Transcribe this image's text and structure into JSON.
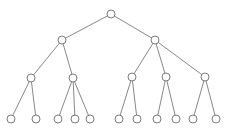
{
  "diagram": {
    "type": "tree",
    "levels": 4,
    "node_radius": 4,
    "colors": {
      "edge": "#7a7a7a",
      "node_stroke": "#6e6e6e",
      "node_fill": "#ffffff",
      "background": "#ffffff"
    },
    "nodes": [
      {
        "id": "root",
        "x": 111,
        "y": 14,
        "level": 0
      },
      {
        "id": "a",
        "x": 62,
        "y": 40,
        "level": 1,
        "parent": "root"
      },
      {
        "id": "b",
        "x": 155,
        "y": 40,
        "level": 1,
        "parent": "root"
      },
      {
        "id": "a1",
        "x": 31,
        "y": 78,
        "level": 2,
        "parent": "a"
      },
      {
        "id": "a2",
        "x": 73,
        "y": 78,
        "level": 2,
        "parent": "a"
      },
      {
        "id": "b1",
        "x": 132,
        "y": 77,
        "level": 2,
        "parent": "b"
      },
      {
        "id": "b2",
        "x": 166,
        "y": 77,
        "level": 2,
        "parent": "b"
      },
      {
        "id": "b3",
        "x": 205,
        "y": 77,
        "level": 2,
        "parent": "b"
      },
      {
        "id": "a1x",
        "x": 11,
        "y": 119,
        "level": 3,
        "parent": "a1"
      },
      {
        "id": "a1y",
        "x": 36,
        "y": 119,
        "level": 3,
        "parent": "a1"
      },
      {
        "id": "a2x",
        "x": 58,
        "y": 119,
        "level": 3,
        "parent": "a2"
      },
      {
        "id": "a2y",
        "x": 75,
        "y": 119,
        "level": 3,
        "parent": "a2"
      },
      {
        "id": "a2z",
        "x": 90,
        "y": 119,
        "level": 3,
        "parent": "a2"
      },
      {
        "id": "b1x",
        "x": 119,
        "y": 119,
        "level": 3,
        "parent": "b1"
      },
      {
        "id": "b1y",
        "x": 137,
        "y": 119,
        "level": 3,
        "parent": "b1"
      },
      {
        "id": "b2x",
        "x": 157,
        "y": 119,
        "level": 3,
        "parent": "b2"
      },
      {
        "id": "b2y",
        "x": 176,
        "y": 119,
        "level": 3,
        "parent": "b2"
      },
      {
        "id": "b3x",
        "x": 193,
        "y": 119,
        "level": 3,
        "parent": "b3"
      },
      {
        "id": "b3y",
        "x": 216,
        "y": 119,
        "level": 3,
        "parent": "b3"
      }
    ]
  }
}
